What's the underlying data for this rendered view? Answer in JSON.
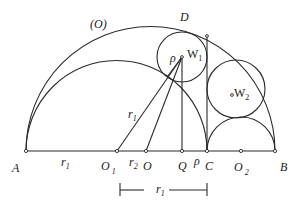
{
  "figure": {
    "title_label": "(O)",
    "points": {
      "A": {
        "label": "A",
        "x": 26,
        "y": 151
      },
      "O1": {
        "label": "O",
        "sub": "1",
        "x": 117,
        "y": 151
      },
      "O": {
        "label": "O",
        "x": 146,
        "y": 151
      },
      "Q": {
        "label": "Q",
        "x": 182,
        "y": 151
      },
      "C": {
        "label": "C",
        "x": 207,
        "y": 151
      },
      "O2": {
        "label": "O",
        "sub": "2",
        "x": 241,
        "y": 151
      },
      "B": {
        "label": "B",
        "x": 275,
        "y": 151
      },
      "D": {
        "label": "D",
        "x": 187,
        "y": 27
      },
      "W1": {
        "label": "W",
        "sub": "1",
        "x": 182,
        "y": 57
      },
      "W2": {
        "label": "W",
        "sub": "2",
        "x": 236,
        "y": 89
      },
      "T": {
        "x": 207,
        "y": 36
      }
    },
    "circles": {
      "big": {
        "name": "(O)",
        "cx": 150.5,
        "cy": 151,
        "r": 124.5
      },
      "inner": {
        "cx": 116.5,
        "cy": 151,
        "r": 90.5
      },
      "small": {
        "cx": 241,
        "cy": 151,
        "r": 34
      },
      "w1": {
        "cx": 182,
        "cy": 57,
        "r": 25
      },
      "w2": {
        "cx": 236,
        "cy": 89,
        "r": 29
      }
    },
    "segment_labels": {
      "r1_base": {
        "label": "r",
        "sub": "1"
      },
      "r1_slant": {
        "label": "r",
        "sub": "1"
      },
      "r2": {
        "label": "r",
        "sub": "2"
      },
      "rho_w1": {
        "label": "ρ"
      },
      "rho_qc": {
        "label": "ρ"
      },
      "r1_bracket": {
        "label": "r",
        "sub": "1"
      }
    }
  }
}
